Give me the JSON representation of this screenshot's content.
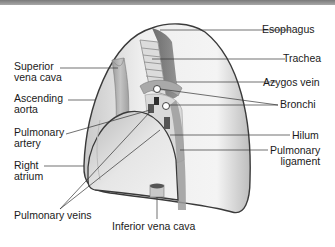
{
  "diagram": {
    "colors": {
      "lung_fill_light": "#f2f2f2",
      "lung_fill_mid": "#d4d4d4",
      "lung_outline": "#3a3a3a",
      "structure_dark": "#6e6e6e",
      "leader_line": "#333333",
      "top_bar": "#8c8c8c"
    },
    "labels_left": [
      {
        "id": "superior-vena-cava",
        "line1": "Superior",
        "line2": "vena cava"
      },
      {
        "id": "ascending-aorta",
        "line1": "Ascending",
        "line2": "aorta"
      },
      {
        "id": "pulmonary-artery",
        "line1": "Pulmonary",
        "line2": "artery"
      },
      {
        "id": "right-atrium",
        "line1": "Right",
        "line2": "atrium"
      },
      {
        "id": "pulmonary-veins",
        "line1": "Pulmonary veins"
      }
    ],
    "labels_right": [
      {
        "id": "esophagus",
        "line1": "Esophagus"
      },
      {
        "id": "trachea",
        "line1": "Trachea"
      },
      {
        "id": "azygos-vein",
        "line1": "Azygos vein"
      },
      {
        "id": "bronchi",
        "line1": "Bronchi"
      },
      {
        "id": "hilum",
        "line1": "Hilum"
      },
      {
        "id": "pulmonary-ligament",
        "line1": "Pulmonary",
        "line2": "ligament"
      }
    ],
    "labels_bottom": [
      {
        "id": "inferior-vena-cava",
        "line1": "Inferior vena cava"
      }
    ]
  }
}
